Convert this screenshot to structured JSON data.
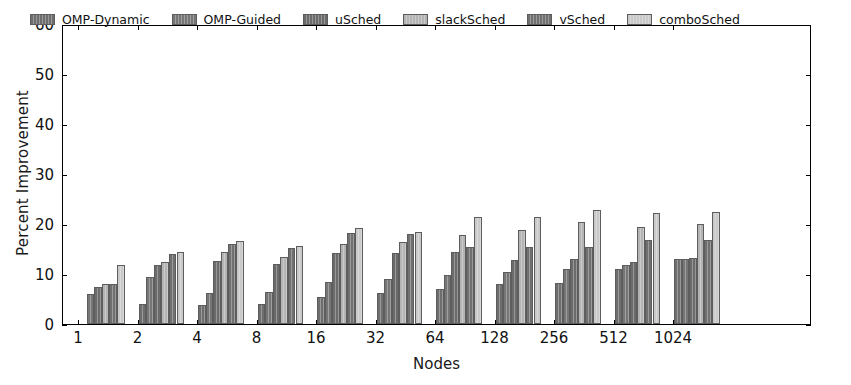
{
  "chart_data": {
    "type": "bar",
    "title": "",
    "xlabel": "Nodes",
    "ylabel": "Percent Improvement",
    "categories": [
      "1",
      "2",
      "4",
      "8",
      "16",
      "32",
      "64",
      "128",
      "256",
      "512",
      "1024"
    ],
    "ylim": [
      0,
      60
    ],
    "yticks": [
      0,
      10,
      20,
      30,
      40,
      50,
      60
    ],
    "grid": false,
    "legend_position": "upper left (inside axes)",
    "series": [
      {
        "name": "OMP-Dynamic",
        "color": "#6e6e6e",
        "values": [
          0,
          4.0,
          3.8,
          4.0,
          5.5,
          6.3,
          7.0,
          8.0,
          8.3,
          11.0,
          13.0
        ]
      },
      {
        "name": "OMP-Guided",
        "color": "#767676",
        "values": [
          6.0,
          9.5,
          6.3,
          6.5,
          8.5,
          9.0,
          9.8,
          10.5,
          11.0,
          11.8,
          13.0
        ]
      },
      {
        "name": "uSched",
        "color": "#6b6b6b",
        "values": [
          7.5,
          11.8,
          12.7,
          12.0,
          14.3,
          14.3,
          14.5,
          12.8,
          13.0,
          12.5,
          13.2
        ]
      },
      {
        "name": "slackSched",
        "color": "#b4b4b4",
        "values": [
          8.0,
          12.5,
          14.5,
          13.5,
          16.0,
          16.5,
          17.8,
          18.8,
          20.5,
          19.5,
          20.0
        ]
      },
      {
        "name": "vSched",
        "color": "#707070",
        "values": [
          8.0,
          14.0,
          16.0,
          15.3,
          18.3,
          18.0,
          15.5,
          15.5,
          15.5,
          16.8,
          16.8
        ]
      },
      {
        "name": "comboSched",
        "color": "#c9c9c9",
        "values": [
          11.8,
          14.5,
          16.7,
          15.7,
          19.3,
          18.5,
          21.5,
          21.5,
          22.8,
          22.3,
          22.4
        ]
      }
    ]
  }
}
